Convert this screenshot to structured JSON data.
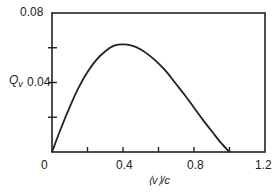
{
  "chart_data": {
    "type": "line",
    "title": "",
    "xlabel": "⟨v⟩/c",
    "ylabel": "Q_v",
    "xlim": [
      0,
      1.2
    ],
    "ylim": [
      0,
      0.08
    ],
    "x_ticks": [
      0,
      0.2,
      0.4,
      0.6,
      0.8,
      1.0,
      1.2
    ],
    "x_tick_labels": [
      "0",
      "",
      "0.4",
      "",
      "0.8",
      "",
      "1.2"
    ],
    "y_ticks": [
      0,
      0.02,
      0.04,
      0.06,
      0.08
    ],
    "y_tick_labels": [
      "",
      "",
      "0.04",
      "",
      "0.08"
    ],
    "grid": false,
    "legend": null,
    "series": [
      {
        "name": "Q_v",
        "x": [
          0,
          0.05,
          0.1,
          0.15,
          0.2,
          0.25,
          0.3,
          0.35,
          0.4,
          0.45,
          0.5,
          0.55,
          0.6,
          0.65,
          0.7,
          0.75,
          0.8,
          0.85,
          0.9,
          0.95,
          1.0
        ],
        "values": [
          0,
          0.0135,
          0.026,
          0.037,
          0.046,
          0.053,
          0.058,
          0.0612,
          0.062,
          0.0612,
          0.059,
          0.0555,
          0.051,
          0.0455,
          0.039,
          0.0325,
          0.0255,
          0.0185,
          0.012,
          0.0055,
          0
        ]
      }
    ]
  },
  "labels": {
    "y_axis_name": "Q",
    "y_axis_sub": "v",
    "y_top": "0.08",
    "y_mid": "0.04",
    "x_0": "0",
    "x_04": "0.4",
    "x_08": "0.8",
    "x_12": "1.2",
    "x_axis": "⟨v⟩/c"
  }
}
